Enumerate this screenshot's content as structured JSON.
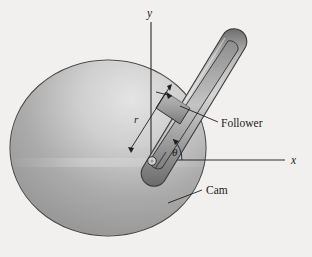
{
  "figure": {
    "type": "mechanical-diagram",
    "background_color": "#f2f0ee"
  },
  "axes": {
    "y_label": "y",
    "x_label": "x",
    "origin_note": "pivot at base of slotted rod",
    "color": "#2b2b2b"
  },
  "labels": {
    "radius": "r",
    "angle": "θ",
    "follower": "Follower",
    "cam": "Cam"
  },
  "parts": {
    "cam": {
      "name": "Cam",
      "shape": "disc",
      "fill_light": "#d9d9d9",
      "fill_dark": "#8a8a8a",
      "outline": "#3a3a3a"
    },
    "rod": {
      "name": "slotted rod",
      "fill_light": "#c9c9c9",
      "fill_dark": "#7d7d7d",
      "outline": "#3a3a3a"
    },
    "follower_block": {
      "name": "Follower",
      "fill": "#a8a8a8",
      "outline": "#2f2f2f"
    },
    "pivot": {
      "name": "pivot pin",
      "fill": "#d0d0d0",
      "outline": "#2f2f2f"
    }
  }
}
